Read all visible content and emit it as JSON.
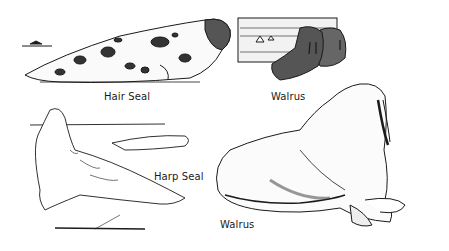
{
  "illustration": {
    "background": "#ffffff",
    "ink": "#1a1a1a",
    "labels": {
      "hair_seal": "Hair Seal",
      "walrus_top": "Walrus",
      "harp_seal": "Harp Seal",
      "walrus_bottom": "Walrus"
    }
  }
}
